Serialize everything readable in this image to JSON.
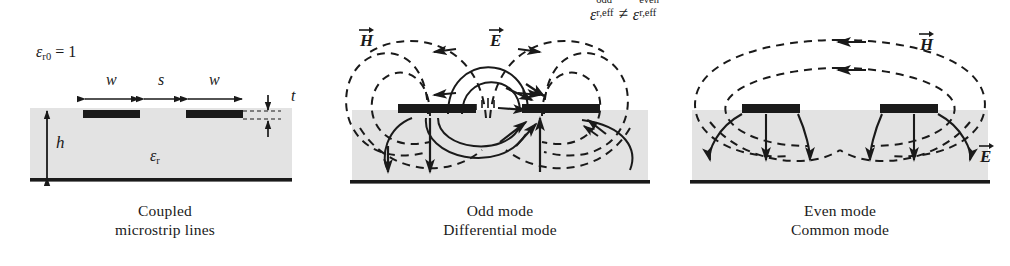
{
  "figure": {
    "relation": {
      "eps_symbol": "ε",
      "lhs_sub": "r,eff",
      "lhs_sup": "odd",
      "operator": "≠",
      "rhs_sub": "r,eff",
      "rhs_sup": "even"
    },
    "colors": {
      "substrate_fill": "#e3e3e3",
      "conductor": "#1a1a1a",
      "line": "#1a1a1a",
      "background": "#ffffff"
    }
  },
  "panels": [
    {
      "id": "coupled-microstrip-lines",
      "caption_line1": "Coupled",
      "caption_line2": "microstrip lines",
      "labels": {
        "eps_r0_symbol": "ε",
        "eps_r0_sub": "r0",
        "eps_r0_value": "= 1",
        "width_left": "w",
        "spacing": "s",
        "width_right": "w",
        "thickness": "t",
        "height": "h",
        "eps_r_symbol": "ε",
        "eps_r_sub": "r"
      }
    },
    {
      "id": "odd-mode",
      "caption_line1": "Odd mode",
      "caption_line2": "Differential mode",
      "labels": {
        "h_field": "H",
        "e_field": "E"
      }
    },
    {
      "id": "even-mode",
      "caption_line1": "Even mode",
      "caption_line2": "Common mode",
      "labels": {
        "h_field": "H",
        "e_field": "E"
      }
    }
  ]
}
